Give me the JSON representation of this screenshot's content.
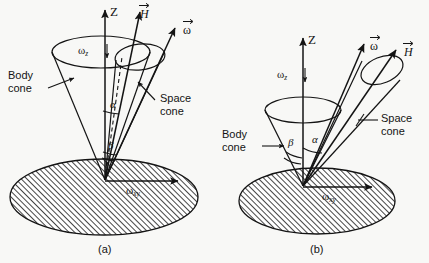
{
  "figure": {
    "type": "technical-diagram",
    "background_color": "#f8f8f6",
    "line_color": "#141414",
    "hatch_color": "#141414"
  },
  "panels": [
    {
      "id": "a",
      "caption": "(a)",
      "axis_label": "Z",
      "labels": {
        "omega_z": "ω",
        "omega_z_sub": "z",
        "omega_xy": "ω",
        "omega_xy_sub": "xy",
        "body_cone_line1": "Body",
        "body_cone_line2": "cone",
        "space_cone_line1": "Space",
        "space_cone_line2": "cone",
        "vector_H": "H",
        "vector_omega": "ω",
        "angle_alpha": "α",
        "angle_beta": "β"
      },
      "notes": "Space cone inside body cone; alpha above beta; dashed H axis line"
    },
    {
      "id": "b",
      "caption": "(b)",
      "axis_label": "Z",
      "labels": {
        "omega_z": "ω",
        "omega_z_sub": "z",
        "omega_xy": "ω",
        "omega_xy_sub": "xy",
        "body_cone_line1": "Body",
        "body_cone_line2": "cone",
        "space_cone_line1": "Space",
        "space_cone_line2": "cone",
        "vector_H": "H",
        "vector_omega": "ω",
        "angle_alpha": "α",
        "angle_beta": "β"
      },
      "notes": "Space cone outside body cone, tilted right; beta left of alpha"
    }
  ]
}
